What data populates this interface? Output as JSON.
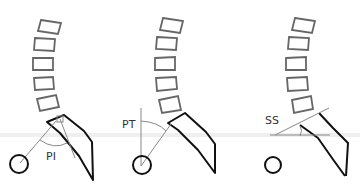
{
  "diagram": {
    "panels": [
      {
        "id": "pelvic-incidence",
        "label": "PI"
      },
      {
        "id": "pelvic-tilt",
        "label": "PT"
      },
      {
        "id": "sacral-slope",
        "label": "SS"
      }
    ],
    "colors": {
      "vertebrae": "#666666",
      "sacrum": "#111111",
      "femoral_head": "#111111",
      "reference_lines": "#888888",
      "background": "#ffffff"
    }
  }
}
